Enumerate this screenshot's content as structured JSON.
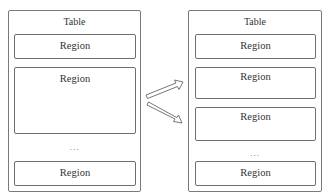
{
  "left_table": {
    "title": "Table",
    "regions": [
      {
        "label": "Region"
      },
      {
        "label": "Region"
      },
      {
        "label": "Region"
      }
    ],
    "ellipsis": "..."
  },
  "right_table": {
    "title": "Table",
    "regions": [
      {
        "label": "Region"
      },
      {
        "label": "Region"
      },
      {
        "label": "Region"
      },
      {
        "label": "Region"
      }
    ],
    "ellipsis": "..."
  },
  "arrows": [
    {
      "direction": "up-right",
      "meaning": "split-region-upper"
    },
    {
      "direction": "down-right",
      "meaning": "split-region-lower"
    }
  ],
  "colors": {
    "border": "#7a7a7a",
    "text": "#333333",
    "background": "#ffffff"
  }
}
